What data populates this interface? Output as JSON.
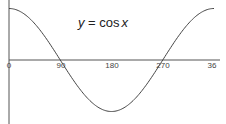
{
  "chart_data": {
    "type": "line",
    "title_parts": {
      "y": "y",
      "eq": " = cos",
      "x": "x"
    },
    "xlabel": "",
    "ylabel": "",
    "x_ticks": [
      "0",
      "90",
      "180",
      "270",
      "36"
    ],
    "x": [
      0,
      45,
      90,
      135,
      180,
      225,
      270,
      315,
      360
    ],
    "series": [
      {
        "name": "cos x",
        "values": [
          1,
          0.707,
          0,
          -0.707,
          -1,
          -0.707,
          0,
          0.707,
          1
        ]
      }
    ],
    "xlim": [
      0,
      360
    ],
    "ylim": [
      -1,
      1
    ],
    "grid": false,
    "legend": "none"
  }
}
